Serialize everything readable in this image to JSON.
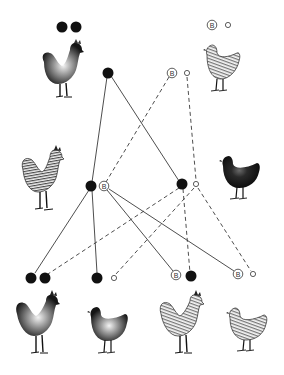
{
  "diagram": {
    "title": "",
    "allele_symbol_barred": "B",
    "colors": {
      "ink": "#111111",
      "line": "#333333",
      "background": "#ffffff"
    },
    "generations": [
      {
        "id": "P",
        "individuals": [
          {
            "id": "p-rooster",
            "sex": "male",
            "plumage": "black",
            "genotype": [
              "black",
              "black"
            ],
            "label_x": 69,
            "label_y": 27
          },
          {
            "id": "p-hen",
            "sex": "female",
            "plumage": "barred",
            "genotype": [
              "B",
              "o"
            ],
            "label_x": 220,
            "label_y": 25
          }
        ],
        "gametes": [
          {
            "id": "g-p-male",
            "alleles": [
              "black"
            ],
            "x": 108,
            "y": 73
          },
          {
            "id": "g-p-female",
            "alleles": [
              "B",
              "o"
            ],
            "x": 179,
            "y": 73
          }
        ]
      },
      {
        "id": "F1",
        "individuals": [
          {
            "id": "f1-rooster",
            "sex": "male",
            "plumage": "barred",
            "genotype": [
              "black",
              "B"
            ]
          },
          {
            "id": "f1-hen",
            "sex": "female",
            "plumage": "black",
            "genotype": [
              "black",
              "o"
            ]
          }
        ]
      },
      {
        "id": "F2",
        "individuals": [
          {
            "id": "f2-1",
            "sex": "male",
            "plumage": "black",
            "genotype": [
              "black",
              "black"
            ]
          },
          {
            "id": "f2-2",
            "sex": "female",
            "plumage": "black",
            "genotype": [
              "black",
              "o"
            ]
          },
          {
            "id": "f2-3",
            "sex": "male",
            "plumage": "barred",
            "genotype": [
              "B",
              "black"
            ]
          },
          {
            "id": "f2-4",
            "sex": "female",
            "plumage": "barred",
            "genotype": [
              "B",
              "o"
            ]
          }
        ]
      }
    ],
    "connections": [
      {
        "from": "P-male-black",
        "to": "F1-rooster-black",
        "style": "solid"
      },
      {
        "from": "P-male-black",
        "to": "F1-hen-black",
        "style": "solid"
      },
      {
        "from": "P-female-B",
        "to": "F1-rooster-B",
        "style": "dashed"
      },
      {
        "from": "P-female-o",
        "to": "F1-hen-o",
        "style": "dashed"
      },
      {
        "from": "F1-rooster-black",
        "to": "F2-1-black",
        "style": "solid"
      },
      {
        "from": "F1-rooster-black",
        "to": "F2-2-black",
        "style": "solid"
      },
      {
        "from": "F1-rooster-B",
        "to": "F2-3-B",
        "style": "solid"
      },
      {
        "from": "F1-rooster-B",
        "to": "F2-4-B",
        "style": "solid"
      },
      {
        "from": "F1-hen-black",
        "to": "F2-1-black2",
        "style": "dashed"
      },
      {
        "from": "F1-hen-black",
        "to": "F2-3-black",
        "style": "dashed"
      },
      {
        "from": "F1-hen-o",
        "to": "F2-2-o",
        "style": "dashed"
      },
      {
        "from": "F1-hen-o",
        "to": "F2-4-o",
        "style": "dashed"
      }
    ]
  }
}
